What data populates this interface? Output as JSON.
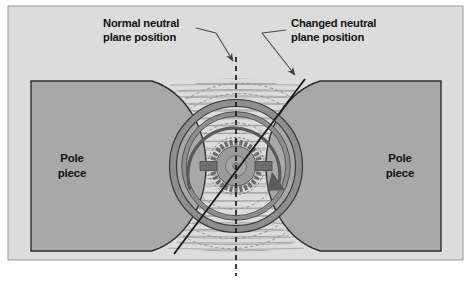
{
  "figure": {
    "kind": "technical-diagram",
    "frame": {
      "background_color": "#DCDCDC",
      "border_color": "#8C8C8C",
      "page_color": "#FFFFFF"
    }
  },
  "callouts": [
    {
      "id": "normal-neutral-plane",
      "line1": "Normal neutral",
      "line2": "plane position",
      "text_color": "#111111",
      "leader_color": "#4A4A4A",
      "points_to": "dashed-vertical-neutral-plane"
    },
    {
      "id": "changed-neutral-plane",
      "line1": "Changed neutral",
      "line2": "plane position",
      "text_color": "#111111",
      "leader_color": "#4A4A4A",
      "points_to": "tilted-solid-neutral-plane"
    }
  ],
  "pole_pieces": [
    {
      "id": "left-pole-piece",
      "line1": "Pole",
      "line2": "piece",
      "fill_color": "#A8A8A8",
      "stroke_color": "#2E2E2E",
      "side": "left",
      "face": "concave"
    },
    {
      "id": "right-pole-piece",
      "line1": "Pole",
      "line2": "piece",
      "fill_color": "#A8A8A8",
      "stroke_color": "#2E2E2E",
      "side": "right",
      "face": "concave"
    }
  ],
  "armature": {
    "id": "armature-assembly",
    "outer_ring_color": "#8E8E8E",
    "outer_ring_stroke": "#3A3A3A",
    "core_color": "#9A9A9A",
    "hub_color": "#A5A5A5",
    "commutator_segment_color": "#707070",
    "brush_color": "#6E6E6E",
    "rotation_arrow_color": "#5A5A5A",
    "rotation_direction": "clockwise",
    "segment_count": 30,
    "brush_count": 2
  },
  "field": {
    "id": "magnetic-field-lines",
    "line_color": "#9C9C9C",
    "distorted_flux_color": "#8A8A8A",
    "horizontal_line_count": 26,
    "dashed_circle_count": 5,
    "description": "Main field flux distorted by armature flux"
  },
  "neutral_planes": {
    "normal": {
      "id": "dashed-vertical-neutral-plane",
      "style": "dashed",
      "color": "#1A1A1A",
      "orientation": "vertical",
      "angle_deg": 0
    },
    "changed": {
      "id": "tilted-solid-neutral-plane",
      "style": "solid",
      "color": "#1A1A1A",
      "orientation": "tilted",
      "angle_deg": 28
    }
  }
}
